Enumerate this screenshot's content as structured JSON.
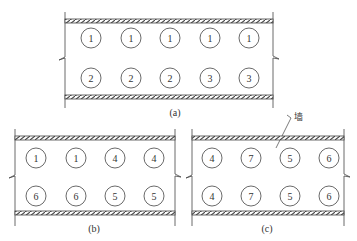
{
  "panels": [
    {
      "id": "a",
      "label": "(a)",
      "rows": [
        [
          "1",
          "1",
          "1",
          "1",
          "1"
        ],
        [
          "2",
          "2",
          "2",
          "3",
          "3"
        ]
      ]
    },
    {
      "id": "b",
      "label": "(b)",
      "rows": [
        [
          "1",
          "1",
          "4",
          "4"
        ],
        [
          "6",
          "6",
          "5",
          "5"
        ]
      ]
    },
    {
      "id": "c",
      "label": "(c)",
      "rows": [
        [
          "4",
          "7",
          "5",
          "6"
        ],
        [
          "4",
          "7",
          "5",
          "6"
        ]
      ]
    }
  ],
  "annotation": {
    "wall_label": "墙"
  },
  "colors": {
    "line": "#444444",
    "background": "#ffffff"
  }
}
